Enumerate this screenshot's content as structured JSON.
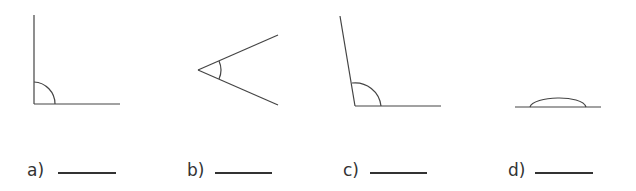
{
  "figures": [
    {
      "id": "a",
      "label": "a)",
      "kind": "right angle"
    },
    {
      "id": "b",
      "label": "b)",
      "kind": "acute angle"
    },
    {
      "id": "c",
      "label": "c)",
      "kind": "obtuse angle"
    },
    {
      "id": "d",
      "label": "d)",
      "kind": "straight angle"
    }
  ],
  "colors": {
    "stroke": "#444444",
    "text": "#333333"
  }
}
